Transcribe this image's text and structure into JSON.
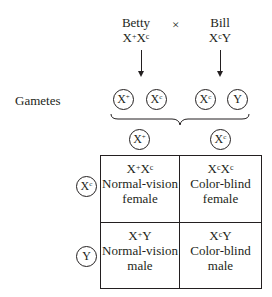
{
  "cross": {
    "mother": {
      "name": "Betty",
      "genotype": {
        "a": "X",
        "a_sup": "+",
        "b": "X",
        "b_sup": "c"
      }
    },
    "symbol": "×",
    "father": {
      "name": "Bill",
      "genotype": {
        "a": "X",
        "a_sup": "c",
        "b": "Y",
        "b_sup": ""
      }
    }
  },
  "gametes_label": "Gametes",
  "parent_gametes": [
    {
      "base": "X",
      "sup": "+"
    },
    {
      "base": "X",
      "sup": "c"
    },
    {
      "base": "X",
      "sup": "c"
    },
    {
      "base": "Y",
      "sup": ""
    }
  ],
  "punnett": {
    "column_gametes": [
      {
        "base": "X",
        "sup": "+"
      },
      {
        "base": "X",
        "sup": "c"
      }
    ],
    "row_gametes": [
      {
        "base": "X",
        "sup": "c"
      },
      {
        "base": "Y",
        "sup": ""
      }
    ],
    "cells": [
      [
        {
          "g1": "X",
          "s1": "+",
          "g2": "X",
          "s2": "c",
          "phenotype": "Normal-vision",
          "sex": "female"
        },
        {
          "g1": "X",
          "s1": "c",
          "g2": "X",
          "s2": "c",
          "phenotype": "Color-blind",
          "sex": "female"
        }
      ],
      [
        {
          "g1": "X",
          "s1": "+",
          "g2": "Y",
          "s2": "",
          "phenotype": "Normal-vision",
          "sex": "male"
        },
        {
          "g1": "X",
          "s1": "c",
          "g2": "Y",
          "s2": "",
          "phenotype": "Color-blind",
          "sex": "male"
        }
      ]
    ]
  }
}
